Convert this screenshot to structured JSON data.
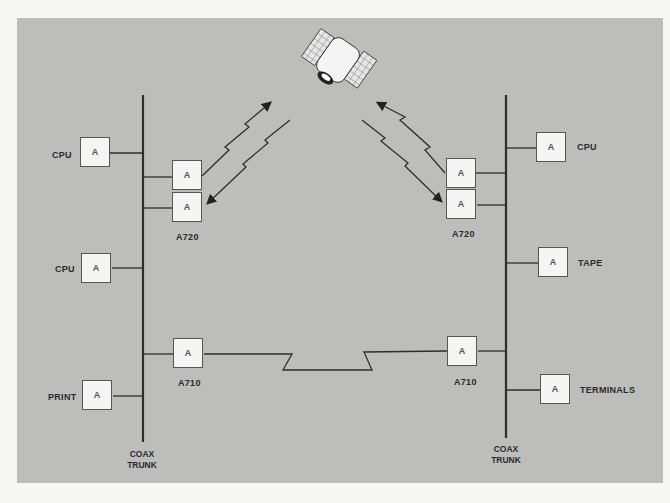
{
  "diagram": {
    "type": "network-topology",
    "colors": {
      "background": "#bdbdbb",
      "node_fill": "#f5f5f3",
      "line": "#3a3a3a",
      "page": "#f7f7f5"
    }
  },
  "left_network": {
    "trunk_label": [
      "COAX",
      "TRUNK"
    ],
    "devices": [
      {
        "label": "CPU",
        "adapter": "A"
      },
      {
        "label": "CPU",
        "adapter": "A"
      },
      {
        "label": "PRINT",
        "adapter": "A"
      }
    ],
    "satellite_gateway": {
      "label": "A720",
      "adapters": [
        "A",
        "A"
      ]
    },
    "link_gateway": {
      "label": "A710",
      "adapter": "A"
    }
  },
  "right_network": {
    "trunk_label": [
      "COAX",
      "TRUNK"
    ],
    "devices": [
      {
        "label": "CPU",
        "adapter": "A"
      },
      {
        "label": "TAPE",
        "adapter": "A"
      },
      {
        "label": "TERMINALS",
        "adapter": "A"
      }
    ],
    "satellite_gateway": {
      "label": "A720",
      "adapters": [
        "A",
        "A"
      ]
    },
    "link_gateway": {
      "label": "A710",
      "adapter": "A"
    }
  },
  "satellite": {
    "icon": "satellite-icon"
  },
  "links": [
    {
      "from": "left A720",
      "to": "satellite",
      "kind": "wireless-bidirectional"
    },
    {
      "from": "right A720",
      "to": "satellite",
      "kind": "wireless-bidirectional"
    },
    {
      "from": "left A710",
      "to": "right A710",
      "kind": "leased-line"
    }
  ]
}
